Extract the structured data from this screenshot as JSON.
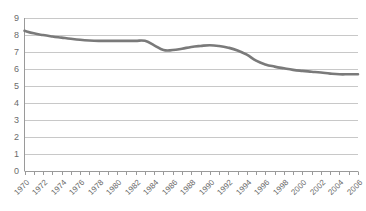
{
  "chart_data": {
    "type": "line",
    "title": "",
    "subtitle": "",
    "xlabel": "",
    "ylabel": "",
    "xlim": [
      1970,
      2006
    ],
    "ylim": [
      0,
      9
    ],
    "grid": "horizontal",
    "legend": "none",
    "y_ticks": [
      9,
      8,
      7,
      6,
      5,
      4,
      3,
      2,
      1,
      0
    ],
    "y_tick_labels": [
      "9",
      "8",
      "7",
      "6",
      "5",
      "4",
      "3",
      "2",
      "1",
      "0"
    ],
    "x_tick_labels": [
      "1970",
      "1972",
      "1974",
      "1976",
      "1978",
      "1980",
      "1982",
      "1984",
      "1986",
      "1988",
      "1990",
      "1992",
      "1994",
      "1996",
      "1998",
      "2000",
      "2002",
      "2004",
      "2006"
    ],
    "x_minor_tick_interval": 1,
    "series": [
      {
        "name": "series-1",
        "color": "#7a7a7a",
        "line_width": 2.6,
        "x": [
          1970,
          1971,
          1972,
          1973,
          1974,
          1975,
          1976,
          1977,
          1978,
          1979,
          1980,
          1981,
          1982,
          1983,
          1984,
          1985,
          1986,
          1987,
          1988,
          1989,
          1990,
          1991,
          1992,
          1993,
          1994,
          1995,
          1996,
          1997,
          1998,
          1999,
          2000,
          2001,
          2002,
          2003,
          2004,
          2005,
          2006
        ],
        "values": [
          8.25,
          8.1,
          8.0,
          7.92,
          7.85,
          7.78,
          7.72,
          7.68,
          7.66,
          7.66,
          7.66,
          7.66,
          7.66,
          7.66,
          7.4,
          7.12,
          7.12,
          7.2,
          7.3,
          7.36,
          7.4,
          7.36,
          7.26,
          7.1,
          6.85,
          6.5,
          6.28,
          6.15,
          6.05,
          5.96,
          5.9,
          5.85,
          5.8,
          5.74,
          5.7,
          5.7,
          5.7
        ]
      }
    ]
  },
  "colors": {
    "line": "#7a7a7a",
    "gridline": "#c8c8c8",
    "axis": "#9a9a9a",
    "tick_text": "#6b6b6b",
    "background": "#ffffff"
  }
}
